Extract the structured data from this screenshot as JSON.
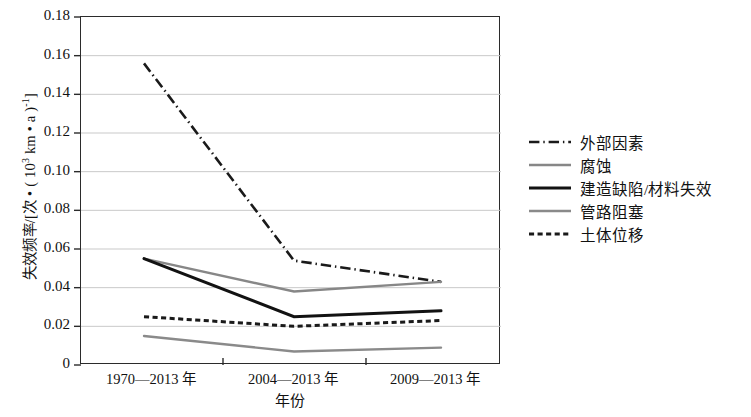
{
  "chart_data": {
    "type": "line",
    "title": "",
    "xlabel": "年份",
    "ylabel": "失效频率/[次·(10³ km·a)⁻¹]",
    "categories": [
      "1970—2013 年",
      "2004—2013 年",
      "2009—2013 年"
    ],
    "ylim": [
      0,
      0.18
    ],
    "ytick_labels": [
      "0",
      "0.02",
      "0.04",
      "0.06",
      "0.08",
      "0.10",
      "0.12",
      "0.14",
      "0.16",
      "0.18"
    ],
    "ytick_values": [
      0,
      0.02,
      0.04,
      0.06,
      0.08,
      0.1,
      0.12,
      0.14,
      0.16,
      0.18
    ],
    "grid": true,
    "grid_axis": "y",
    "legend_position": "right",
    "series": [
      {
        "name": "外部因素",
        "values": [
          0.156,
          0.054,
          0.043
        ],
        "style": "dashdot",
        "color": "#1a1a1a",
        "width": 2.6
      },
      {
        "name": "腐蚀",
        "values": [
          0.055,
          0.038,
          0.043
        ],
        "style": "solid",
        "color": "#878787",
        "width": 2.4
      },
      {
        "name": "建造缺陷/材料失效",
        "values": [
          0.055,
          0.025,
          0.028
        ],
        "style": "solid",
        "color": "#121212",
        "width": 3.0
      },
      {
        "name": "管路阻塞",
        "values": [
          0.015,
          0.007,
          0.009
        ],
        "style": "solid",
        "color": "#8a8a8a",
        "width": 2.4
      },
      {
        "name": "土体位移",
        "values": [
          0.025,
          0.02,
          0.023
        ],
        "style": "dotted",
        "color": "#1a1a1a",
        "width": 3.0
      }
    ]
  },
  "axis": {
    "ylabel_main": "失效频率/[次 • ( 10",
    "ylabel_sup1": "3",
    "ylabel_mid": " km • a )",
    "ylabel_sup2": "-1",
    "ylabel_end": "]",
    "xlabel": "年份"
  },
  "colors": {
    "frame": "#2b2b2b",
    "grid": "#c9c9c9",
    "background": "#ffffff",
    "text": "#111111"
  }
}
